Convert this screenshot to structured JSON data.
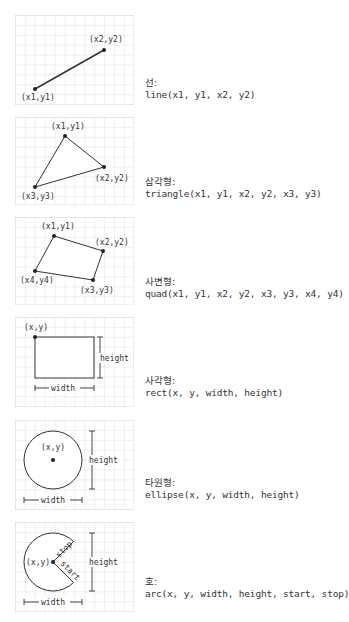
{
  "colors": {
    "grid": "#d9d9d9",
    "stroke": "#333333",
    "text": "#333333",
    "background": "#ffffff"
  },
  "panels": [
    {
      "id": "line",
      "title": "선:",
      "signature": "line(x1, y1, x2, y2)",
      "labels": {
        "p1": "(x1,y1)",
        "p2": "(x2,y2)"
      }
    },
    {
      "id": "triangle",
      "title": "삼각형:",
      "signature": "triangle(x1, y1, x2, y2, x3, y3)",
      "labels": {
        "p1": "(x1,y1)",
        "p2": "(x2,y2)",
        "p3": "(x3,y3)"
      }
    },
    {
      "id": "quad",
      "title": "사변형:",
      "signature": "quad(x1, y1, x2, y2, x3, y3, x4, y4)",
      "labels": {
        "p1": "(x1,y1)",
        "p2": "(x2,y2)",
        "p3": "(x3,y3)",
        "p4": "(x4,y4)"
      }
    },
    {
      "id": "rect",
      "title": "사각형:",
      "signature": "rect(x, y, width, height)",
      "labels": {
        "origin": "(x,y)",
        "width": "width",
        "height": "height"
      }
    },
    {
      "id": "ellipse",
      "title": "타원형:",
      "signature": "ellipse(x, y, width, height)",
      "labels": {
        "origin": "(x,y)",
        "width": "width",
        "height": "height"
      }
    },
    {
      "id": "arc",
      "title": "호:",
      "signature": "arc(x, y, width, height, start, stop)",
      "labels": {
        "origin": "(x,y)",
        "width": "width",
        "height": "height",
        "start": "start",
        "stop": "stop"
      }
    }
  ]
}
